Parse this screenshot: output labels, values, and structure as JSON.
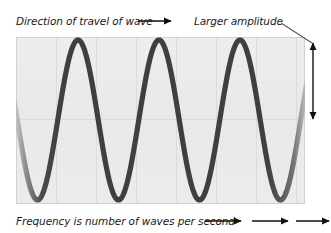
{
  "figure": {
    "background_color": "#ffffff",
    "plot_background_color": "#ebebeb",
    "wave_color": "#3f3f3f",
    "grid_color": "#dcdcdc",
    "annotation_color": "#1a1a1a"
  },
  "annotations": {
    "direction_label": "Direction of travel of wave",
    "amplitude_label": "Larger amplitude",
    "frequency_label": "Frequency is number of waves per second"
  },
  "chart_data": {
    "type": "line",
    "title": "",
    "xlabel": "",
    "ylabel": "",
    "waveform": "sine",
    "cycles": 3.45,
    "amplitude": 80,
    "baseline_y": 120,
    "peak_y": 40,
    "trough_y": 200,
    "wavelength_px": 81,
    "phase_offset_px": 19,
    "plot_area": {
      "x": 16,
      "y": 37,
      "width": 289,
      "height": 167
    },
    "xlim": [
      16,
      305
    ],
    "ylim": [
      37,
      204
    ],
    "grid": true,
    "gridlines_vertical_x": [
      56,
      96,
      136,
      176,
      216,
      256,
      296
    ],
    "gridlines_horizontal_y": [
      119
    ],
    "legend": "none",
    "peaks_x": [
      100,
      181,
      262
    ],
    "peaks_y": [
      40,
      40,
      40
    ],
    "troughs_x": [
      60,
      141,
      222
    ],
    "troughs_y": [
      200,
      200,
      200
    ],
    "series": [
      {
        "name": "wave",
        "values": [
          120,
          40,
          120,
          200,
          120,
          40,
          120,
          200,
          120,
          40,
          120,
          200,
          120
        ]
      }
    ]
  },
  "markers": {
    "direction_arrow": {
      "x1": 138,
      "y1": 21,
      "x2": 173,
      "y2": 21
    },
    "amplitude_arrow": {
      "x": 313,
      "y_top": 40,
      "y_bottom": 122
    },
    "amplitude_leader": {
      "x1": 281,
      "y1": 24,
      "x2": 312,
      "y2": 44
    },
    "frequency_arrows": [
      {
        "x1": 205,
        "y1": 221,
        "x2": 243,
        "y2": 221
      },
      {
        "x1": 252,
        "y1": 221,
        "x2": 290,
        "y2": 221
      },
      {
        "x1": 296,
        "y1": 221,
        "x2": 330,
        "y2": 221
      }
    ]
  }
}
